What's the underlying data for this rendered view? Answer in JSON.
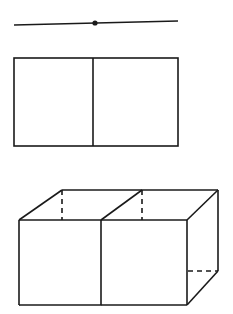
{
  "figure": {
    "background_color": "#ffffff",
    "stroke_color": "#1a1a1a",
    "dash_color": "#1a1a1a",
    "fill_color": "#ffffff",
    "canvas": {
      "width": 233,
      "height": 314
    }
  },
  "shapes": {
    "segment": {
      "name": "one-dimensional-segment",
      "label": "line segment with midpoint",
      "x1": 14,
      "y1": 25,
      "x2": 178,
      "y2": 21,
      "stroke_width": 1.6,
      "midpoint": {
        "cx": 95,
        "cy": 23,
        "r": 2.6
      }
    },
    "rectangle": {
      "name": "two-dimensional-square-pair",
      "label": "rectangle divided into two squares",
      "left": 14,
      "top": 58,
      "right": 178,
      "bottom": 146,
      "divider_x": 93,
      "stroke_width": 1.6
    },
    "cuboid": {
      "name": "three-dimensional-cube-pair",
      "label": "cuboid divided into two cubes with hidden edges dashed",
      "stroke_width": 1.6,
      "dash_pattern": "5,4",
      "front_face": {
        "left": 19,
        "top": 220,
        "right": 187,
        "bottom": 305
      },
      "depth_offset": {
        "dx": 43,
        "dy": -30
      },
      "back_face": {
        "left": 62,
        "top": 190,
        "right": 218,
        "bottom": 271
      },
      "divider_front_x": 101,
      "divider_back_x": 142,
      "visible_edges": [
        "front-top",
        "front-bottom",
        "front-left",
        "front-right",
        "front-divider-vertical",
        "back-top",
        "back-right",
        "top-left-diagonal",
        "top-divider-diagonal",
        "top-right-diagonal",
        "bottom-right-diagonal"
      ],
      "hidden_edges": [
        "back-left-vertical",
        "back-divider-vertical",
        "back-bottom-horizontal",
        "bottom-left-diagonal",
        "bottom-divider-diagonal"
      ]
    }
  }
}
